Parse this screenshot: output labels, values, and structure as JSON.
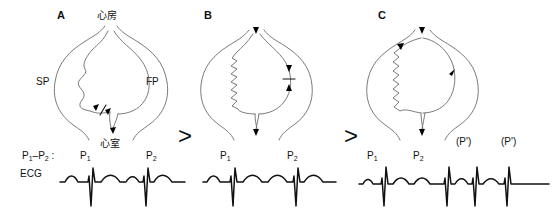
{
  "figure": {
    "separators": [
      ">",
      ">"
    ],
    "stroke_color": "#5a5a5a",
    "ecg_color": "#111111",
    "arrow_color": "#000000"
  },
  "panels": [
    {
      "letter": "A",
      "labels": {
        "atrium": "心房",
        "ventricle": "心室",
        "slow_pathway": "SP",
        "fast_pathway": "FP",
        "interval": "P",
        "interval_sub1": "1",
        "interval_dash": "–P",
        "interval_sub2": "2",
        "interval_colon": " :",
        "ecg_name": "ECG"
      },
      "ecg": {
        "p_waves": [
          "P",
          "P"
        ],
        "p_subs": [
          "1",
          "2"
        ],
        "beats": 2,
        "description": "Sinus beat followed by premature atrial beat, both conducted"
      },
      "anatomy": {
        "slow_pathway_shape": "wavy",
        "fast_pathway_shape": "smooth",
        "block_marker": true,
        "arrows": [
          "antegrade-slow",
          "antegrade-fast-blocked",
          "to-ventricle"
        ]
      }
    },
    {
      "letter": "B",
      "labels": {},
      "ecg": {
        "p_waves": [
          "P",
          "P"
        ],
        "p_subs": [
          "1",
          "2"
        ],
        "beats": 2,
        "description": "Premature beat conducts down slow pathway, fast pathway blocked"
      },
      "anatomy": {
        "slow_pathway_shape": "zigzag",
        "fast_pathway_shape": "smooth",
        "block_marker": true,
        "arrows": [
          "to-atrium",
          "retrograde-fast-blocked",
          "to-ventricle"
        ]
      }
    },
    {
      "letter": "C",
      "labels": {
        "echo_beat_1": "(P')",
        "echo_beat_2": "(P')"
      },
      "ecg": {
        "p_waves": [
          "P",
          "P"
        ],
        "p_subs": [
          "1",
          "2"
        ],
        "echo_labels": [
          "(P')",
          "(P')"
        ],
        "beats": 4,
        "description": "Reentry circuit established producing echo beats / tachycardia"
      },
      "anatomy": {
        "slow_pathway_shape": "zigzag",
        "fast_pathway_shape": "smooth",
        "circuit": "reentrant-loop",
        "arrows": [
          "retrograde-to-atrium",
          "loop-top",
          "retrograde-fast-up",
          "to-ventricle"
        ]
      }
    }
  ]
}
